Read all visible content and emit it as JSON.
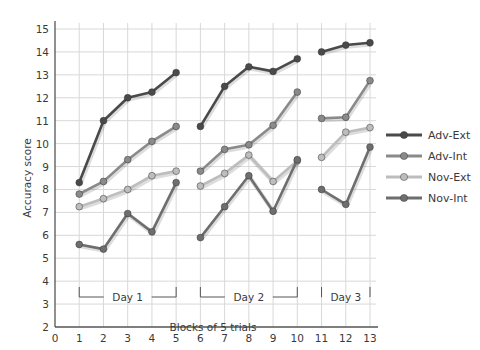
{
  "chart_data": {
    "type": "line",
    "title": "",
    "xlabel": "Blocks of 5 trials",
    "ylabel": "Accuracy score",
    "xlim": [
      0,
      13
    ],
    "ylim": [
      2,
      15
    ],
    "x_ticks": [
      "0",
      "1",
      "2",
      "3",
      "4",
      "5",
      "6",
      "7",
      "8",
      "9",
      "10",
      "11",
      "12",
      "13"
    ],
    "y_ticks": [
      "2",
      "3",
      "4",
      "5",
      "6",
      "7",
      "8",
      "9",
      "10",
      "11",
      "12",
      "13",
      "14",
      "15"
    ],
    "grid": true,
    "legend_position": "right",
    "segments": [
      [
        1,
        5
      ],
      [
        6,
        10
      ],
      [
        11,
        13
      ]
    ],
    "day_groups": [
      {
        "label": "Day 1",
        "from": 1,
        "to": 5
      },
      {
        "label": "Day 2",
        "from": 6,
        "to": 10
      },
      {
        "label": "Day 3",
        "from": 11,
        "to": 13
      }
    ],
    "x": [
      1,
      2,
      3,
      4,
      5,
      6,
      7,
      8,
      9,
      10,
      11,
      12,
      13
    ],
    "series": [
      {
        "name": "Adv-Ext",
        "color": "#4a4a4a",
        "values": [
          8.3,
          11.0,
          12.0,
          12.25,
          13.1,
          10.75,
          12.5,
          13.35,
          13.15,
          13.7,
          14.0,
          14.3,
          14.4
        ]
      },
      {
        "name": "Adv-Int",
        "color": "#8a8a8a",
        "values": [
          7.8,
          8.35,
          9.3,
          10.1,
          10.75,
          8.8,
          9.75,
          9.95,
          10.8,
          12.25,
          11.1,
          11.15,
          12.75
        ]
      },
      {
        "name": "Nov-Ext",
        "color": "#bdbdbd",
        "values": [
          7.25,
          7.6,
          8.0,
          8.6,
          8.8,
          8.15,
          8.7,
          9.5,
          8.35,
          9.25,
          9.4,
          10.5,
          10.7
        ]
      },
      {
        "name": "Nov-Int",
        "color": "#6e6e6e",
        "values": [
          5.6,
          5.4,
          6.95,
          6.15,
          8.3,
          5.9,
          7.25,
          8.6,
          7.05,
          9.3,
          8.0,
          7.35,
          9.85
        ]
      }
    ]
  },
  "labels": {
    "ylabel": "Accuracy score",
    "xlabel": "Blocks of 5 trials"
  }
}
